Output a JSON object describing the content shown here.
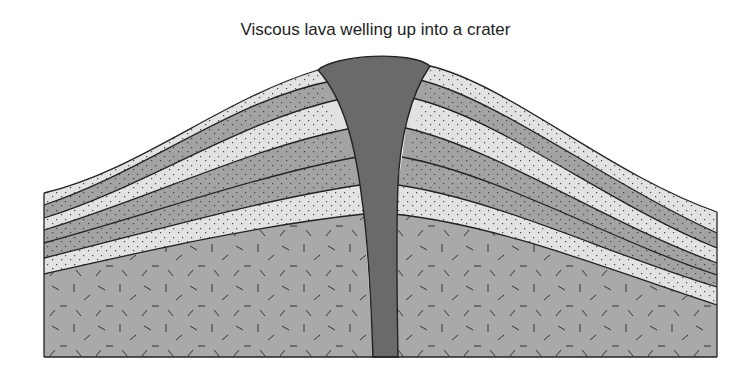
{
  "title": "Viscous lava welling up into a crater",
  "colors": {
    "light_layer": "#e2e2e2",
    "dark_layer": "#a3a3a3",
    "base_rock": "#a9a9a9",
    "lava": "#6a6a6a",
    "outline": "#222222"
  },
  "layers": [
    "tephra-light",
    "lava-dark",
    "tephra-light",
    "lava-dark",
    "lava-dark",
    "tephra-light",
    "basement-rock"
  ]
}
